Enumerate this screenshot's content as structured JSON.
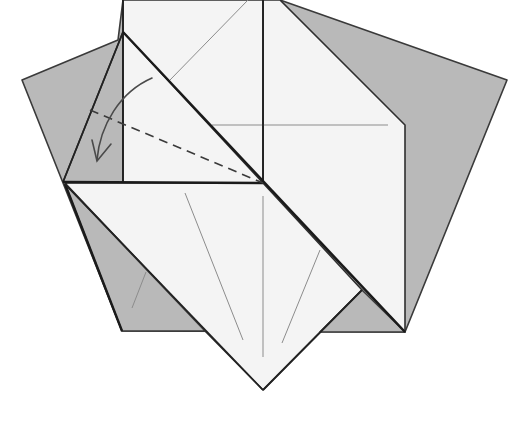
{
  "diagram": {
    "colors": {
      "paper_back": "#b9b9b9",
      "paper_front": "#f4f4f4",
      "edge": "#2e2e2e",
      "crease": "#8c8c8c"
    },
    "elements": [
      {
        "name": "gray-pentagon-base",
        "type": "polygon"
      },
      {
        "name": "top-white-square",
        "type": "polygon"
      },
      {
        "name": "right-white-panel",
        "type": "polygon"
      },
      {
        "name": "left-gray-flap",
        "type": "polygon"
      },
      {
        "name": "lower-white-diamond",
        "type": "polygon"
      },
      {
        "name": "valley-fold-line",
        "type": "dashed-line"
      },
      {
        "name": "fold-direction-arrow",
        "type": "curved-arrow"
      }
    ],
    "instruction": "Valley fold along the dashed line in the direction of the arrow"
  }
}
